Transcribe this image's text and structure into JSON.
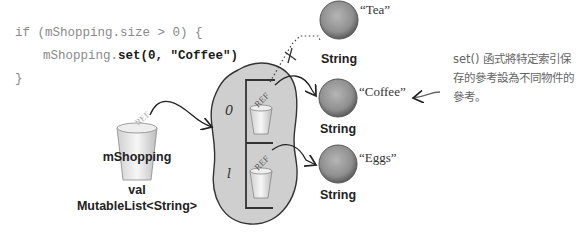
{
  "code": {
    "line1": "if (mShopping.size > 0) {",
    "line2_prefix": "mShopping.",
    "line2_bold": "set(0, \"Coffee\")",
    "line3": "}"
  },
  "variable": {
    "name": "mShopping",
    "kind": "val",
    "type": "MutableList<String>",
    "ref_label": "REF"
  },
  "list": {
    "indices": [
      "0",
      "1"
    ],
    "ref_label": "REF"
  },
  "objects": [
    {
      "value": "“Tea”",
      "type": "String",
      "status": "unreferenced"
    },
    {
      "value": "“Coffee”",
      "type": "String",
      "status": "referenced-index-0"
    },
    {
      "value": "“Eggs”",
      "type": "String",
      "status": "referenced-index-1"
    }
  ],
  "annotation": "set() 函式將特定索引保存的參考設為不同物件的參考。",
  "colors": {
    "blob": "#cfcfcf",
    "ball": "#8f8f8f",
    "code_gray": "#8a8a8a"
  }
}
